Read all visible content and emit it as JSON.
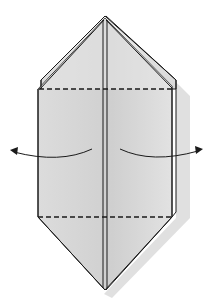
{
  "diagram": {
    "type": "origami-fold-step",
    "colors": {
      "background": "#ffffff",
      "paper": "#d9d9d9",
      "paper_light": "#e6e6e6",
      "shadow": "#cfcfcf",
      "line": "#1a1a1a"
    },
    "elements": {
      "top_apex": [
        105,
        16
      ],
      "bottom_apex": [
        105,
        290
      ],
      "upper_fold_line_y": 89,
      "lower_fold_line_y": 217,
      "left_arrow": "fold left outward",
      "right_arrow": "fold right outward"
    }
  }
}
